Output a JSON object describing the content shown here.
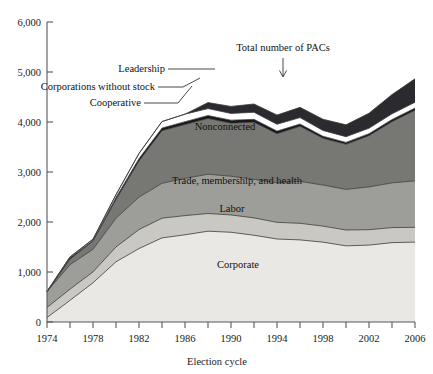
{
  "chart_data": {
    "type": "area",
    "stacked": true,
    "title": "",
    "xlabel": "Election cycle",
    "ylabel": "",
    "xlim": [
      1974,
      2006
    ],
    "ylim": [
      0,
      6000
    ],
    "ytick_values": [
      0,
      1000,
      2000,
      3000,
      4000,
      5000,
      6000
    ],
    "ytick_labels": [
      "0",
      "1,000",
      "2,000",
      "3,000",
      "4,000",
      "5,000",
      "6,000"
    ],
    "x": [
      1974,
      1976,
      1978,
      1980,
      1982,
      1984,
      1986,
      1988,
      1990,
      1992,
      1994,
      1996,
      1998,
      2000,
      2002,
      2004,
      2006
    ],
    "xtick_values": [
      1974,
      1976,
      1978,
      1980,
      1982,
      1984,
      1986,
      1988,
      1990,
      1992,
      1994,
      1996,
      1998,
      2000,
      2002,
      2004,
      2006
    ],
    "xtick_labels": [
      "1974",
      "",
      "1978",
      "",
      "1982",
      "",
      "1986",
      "",
      "1990",
      "",
      "1994",
      "",
      "1998",
      "",
      "2002",
      "",
      "2006"
    ],
    "grid": false,
    "legend_position": "inline-annotations",
    "series": [
      {
        "name": "Corporate",
        "color": "#e9e8e4",
        "label_placement": "inside",
        "values": [
          89,
          433,
          785,
          1204,
          1469,
          1682,
          1744,
          1816,
          1795,
          1735,
          1660,
          1642,
          1597,
          1523,
          1538,
          1587,
          1598
        ]
      },
      {
        "name": "Labor",
        "color": "#c9c8c3",
        "label_placement": "inside",
        "values": [
          201,
          224,
          217,
          297,
          380,
          394,
          384,
          354,
          346,
          347,
          333,
          332,
          321,
          317,
          308,
          301,
          295
        ]
      },
      {
        "name": "Trade, membership, and health",
        "color": "#9d9d99",
        "label_placement": "inside",
        "values": [
          318,
          489,
          453,
          574,
          649,
          698,
          745,
          786,
          774,
          770,
          792,
          838,
          821,
          812,
          856,
          895,
          930
        ]
      },
      {
        "name": "Nonconnected",
        "color": "#777873",
        "label_placement": "inside",
        "values": [
          0,
          110,
          165,
          374,
          723,
          1053,
          1077,
          1115,
          1062,
          1145,
          980,
          1103,
          935,
          902,
          1025,
          1224,
          1412
        ]
      },
      {
        "name": "Cooperative",
        "color": "#17171a",
        "label_placement": "callout-left",
        "values": [
          0,
          31,
          12,
          42,
          47,
          52,
          56,
          59,
          59,
          56,
          53,
          44,
          41,
          38,
          39,
          42,
          43
        ]
      },
      {
        "name": "Corporations without stock",
        "color": "#ffffff",
        "label_placement": "callout-left",
        "values": [
          0,
          15,
          24,
          56,
          103,
          130,
          151,
          138,
          136,
          142,
          136,
          129,
          115,
          114,
          110,
          114,
          117
        ]
      },
      {
        "name": "Leadership",
        "color": "#2b2b2f",
        "label_placement": "callout-left",
        "values": [
          0,
          0,
          0,
          0,
          0,
          0,
          0,
          120,
          140,
          165,
          185,
          205,
          225,
          238,
          300,
          385,
          470
        ]
      }
    ],
    "annotations": [
      {
        "name": "total-pacs",
        "text": "Total number of PACs",
        "kind": "arrow",
        "x": 1994
      }
    ]
  },
  "axis": {
    "x_title": "Election cycle"
  },
  "callouts": {
    "leadership": "Leadership",
    "corporations_without_stock": "Corporations without stock",
    "cooperative": "Cooperative",
    "total": "Total number of PACs"
  }
}
